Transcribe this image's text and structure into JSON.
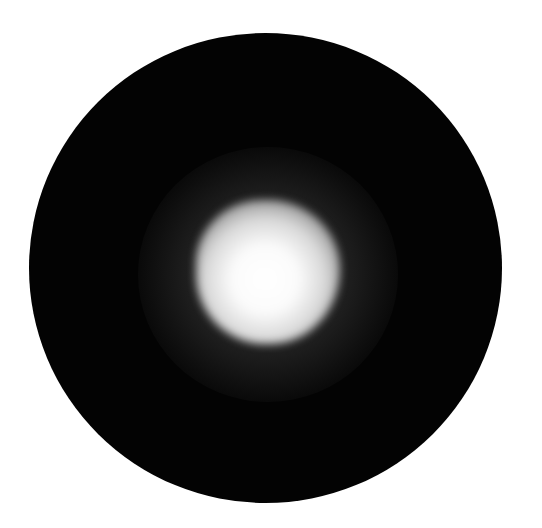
{
  "image": {
    "description": "Black circular field with a bright diffuse white spot near the center",
    "background_color": "#ffffff",
    "disc": {
      "color": "#030303",
      "center": [
        266,
        268
      ],
      "radius_px": 236
    },
    "spot": {
      "center": [
        268,
        272
      ],
      "core_radius_px": 50,
      "halo_radius_px": 125,
      "core_color": "#ffffff",
      "halo_color": "#4a4a4a"
    }
  }
}
